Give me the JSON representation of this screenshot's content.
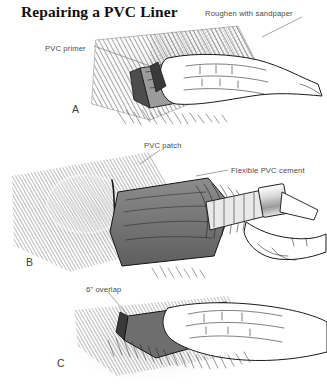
{
  "figure": {
    "title": "Repairing a PVC Liner",
    "background_color": "#ffffff",
    "ink_color": "#1a1a1a",
    "label_color": "#4a4a4a",
    "width": 327,
    "height": 389
  },
  "callouts": [
    {
      "id": "roughen-with-sandpaper",
      "text": "Roughen with sandpaper",
      "x": 205,
      "y": 9,
      "panel": "A"
    },
    {
      "id": "pvc-primer",
      "text": "PVC primer",
      "x": 45,
      "y": 44,
      "panel": "A"
    },
    {
      "id": "pvc-patch",
      "text": "PVC patch",
      "x": 144,
      "y": 141,
      "panel": "B"
    },
    {
      "id": "flexible-pvc-cement",
      "text": "Flexible PVC cement",
      "x": 231,
      "y": 166,
      "panel": "B"
    },
    {
      "id": "six-inch-overlap",
      "text": "6\" overlap",
      "x": 86,
      "y": 285,
      "panel": "C"
    }
  ],
  "panels": [
    {
      "id": "panel-a",
      "letter": "A",
      "letter_x": 72,
      "letter_y": 103,
      "caption": "Roughen the liner with sandpaper and apply PVC primer"
    },
    {
      "id": "panel-b",
      "letter": "B",
      "letter_x": 26,
      "letter_y": 256,
      "caption": "Brush flexible PVC cement onto the PVC patch"
    },
    {
      "id": "panel-c",
      "letter": "C",
      "letter_x": 57,
      "letter_y": 357,
      "caption": "Press the patch down with a 6 inch overlap"
    }
  ]
}
